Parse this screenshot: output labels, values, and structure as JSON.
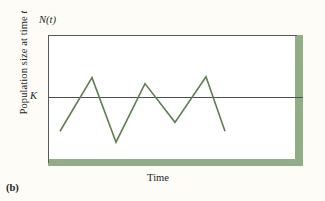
{
  "figure": {
    "panel_letter": "(b)",
    "y_axis_label_prefix": "Population size at time ",
    "y_axis_label_italic": "t",
    "x_axis_label": "Time",
    "top_axis_label_n": "N",
    "top_axis_label_paren_open": "(",
    "top_axis_label_t": "t",
    "top_axis_label_paren_close": ")",
    "carrying_capacity_label": "K"
  },
  "colors": {
    "background": "#fdfcf7",
    "curve": "#5f7d52",
    "accent_bar": "#8fae83",
    "axis_line": "#58595b",
    "k_line": "#4d4e50"
  },
  "chart_data": {
    "type": "line",
    "title": "",
    "subtitle": "",
    "xlabel": "Time",
    "ylabel": "Population size at time t",
    "grid": false,
    "legend": false,
    "axis_top_label": "N(t)",
    "annotations": [
      {
        "name": "carrying-capacity",
        "label": "K",
        "type": "horizontal-reference-line",
        "y": 0
      }
    ],
    "xlim": [
      0,
      255
    ],
    "ylim": [
      -66,
      66
    ],
    "x_ticks": [],
    "y_ticks": [],
    "series": [
      {
        "name": "Population size N(t)",
        "color": "#5f7d52",
        "x": [
          12,
          44,
          68,
          97,
          127,
          158,
          177
        ],
        "y": [
          -31,
          23,
          -42,
          17,
          -22,
          24,
          -31
        ],
        "points": [
          {
            "x": 12,
            "y": -31,
            "role": "start"
          },
          {
            "x": 44,
            "y": 23,
            "role": "peak"
          },
          {
            "x": 68,
            "y": -42,
            "role": "trough"
          },
          {
            "x": 97,
            "y": 17,
            "role": "peak"
          },
          {
            "x": 127,
            "y": -22,
            "role": "trough"
          },
          {
            "x": 158,
            "y": 24,
            "role": "peak"
          },
          {
            "x": 177,
            "y": -31,
            "role": "end"
          }
        ]
      }
    ]
  }
}
